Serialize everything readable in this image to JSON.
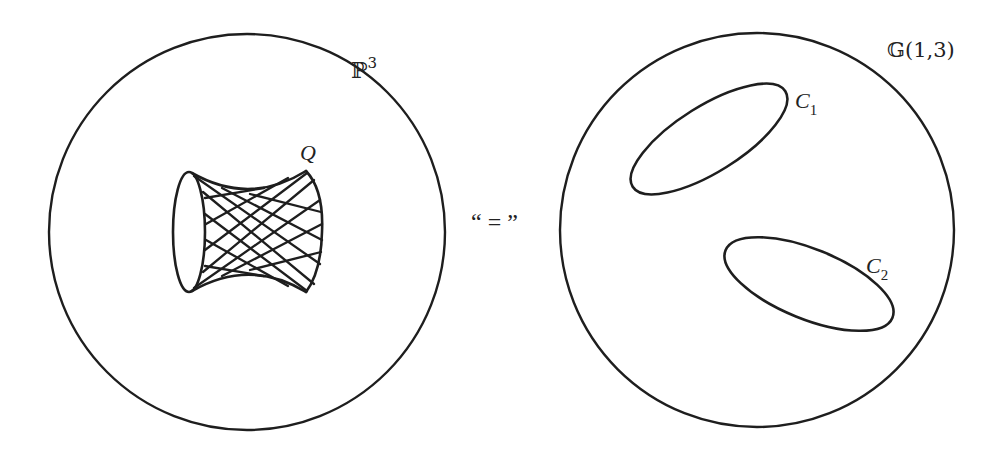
{
  "diagram": {
    "left_panel": {
      "space_label": {
        "base": "ℙ",
        "superscript": "3"
      },
      "space_circle": {
        "cx": 247,
        "cy": 232,
        "r": 198
      },
      "surface": {
        "label": "Q",
        "description": "doubly-ruled quadric surface (hyperboloid) with two families of lines",
        "left_rim": {
          "cx": 189,
          "cy": 232,
          "rx": 16,
          "ry": 60
        },
        "right_rim": {
          "cx": 306,
          "cy": 231,
          "rx": 16,
          "ry": 60
        }
      }
    },
    "relation": {
      "text": "“ = ”"
    },
    "right_panel": {
      "space_label": {
        "text": "𝔾(1,3)"
      },
      "space_circle": {
        "cx": 757,
        "cy": 230,
        "r": 197
      },
      "curves": [
        {
          "label": "C",
          "subscript": "1",
          "cx": 709,
          "cy": 139,
          "rx": 90,
          "ry": 33,
          "rotation": -32
        },
        {
          "label": "C",
          "subscript": "2",
          "cx": 809,
          "cy": 284,
          "rx": 90,
          "ry": 35,
          "rotation": 22
        }
      ]
    },
    "colors": {
      "ink": "#1e1e1e",
      "background": "#ffffff"
    }
  }
}
